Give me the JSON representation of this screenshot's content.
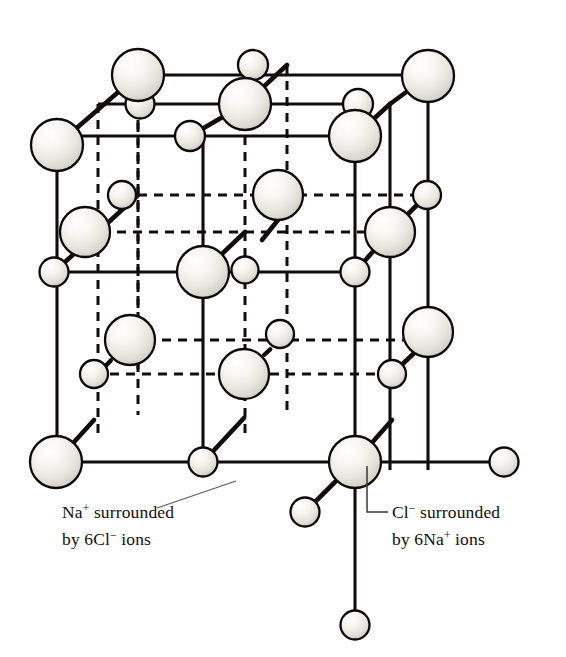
{
  "figure": {
    "background_color": "#ffffff",
    "line_color": "#100d0c",
    "ion_outline_color": "#0d0b0a",
    "ion_fill_light": "#ffffff",
    "ion_fill_mid": "#eceae4",
    "ion_fill_shadow": "#c9c6bd",
    "callout_line_color": "#5d5a59"
  },
  "annotations": [
    {
      "id": "na-callout",
      "name": "na-plus-callout",
      "line1_main": "Na",
      "line1_sup": "+",
      "line1_rest": " surrounded",
      "line2": "by 6Cl",
      "line2_sup": "−",
      "line2_rest": " ions",
      "full_text": "Na+ surrounded by 6Cl− ions",
      "text_x": 62,
      "line1_y": 518,
      "line2_y": 545,
      "leader": {
        "x1": 236,
        "y1": 481,
        "x2": 157,
        "y2": 508
      }
    },
    {
      "id": "cl-callout",
      "name": "cl-minus-callout",
      "line1_main": "Cl",
      "line1_sup": "−",
      "line1_rest": " surrounded",
      "line2": "by 6Na",
      "line2_sup": "+",
      "line2_rest": " ions",
      "full_text": "Cl− surrounded by 6Na+ ions",
      "text_x": 392,
      "line1_y": 518,
      "line2_y": 545,
      "elbow": "M367,466 L367,512 L388,512"
    }
  ],
  "legend": {
    "large_sphere_meaning": "Cl− chloride ion",
    "small_sphere_meaning": "Na+ sodium ion",
    "large_radius": 26,
    "small_radius": 15
  },
  "chart_data": {
    "type": "diagram",
    "ions": [
      {
        "id": "cl-ftl",
        "species": "Cl",
        "cx": 57,
        "cy": 145,
        "r": 26,
        "layer": "front"
      },
      {
        "id": "na-ftl2",
        "species": "Na",
        "cx": 140,
        "cy": 104,
        "r": 14.5,
        "layer": "mid"
      },
      {
        "id": "cl-btl",
        "species": "Cl",
        "cx": 138,
        "cy": 75,
        "r": 26,
        "layer": "back"
      },
      {
        "id": "na-btm",
        "species": "Na",
        "cx": 253,
        "cy": 65,
        "r": 15,
        "layer": "back"
      },
      {
        "id": "cl-btr",
        "species": "Cl",
        "cx": 428,
        "cy": 76,
        "r": 26,
        "layer": "back"
      },
      {
        "id": "na-mtr",
        "species": "Na",
        "cx": 358,
        "cy": 104,
        "r": 15,
        "layer": "mid"
      },
      {
        "id": "cl-mtm",
        "species": "Cl",
        "cx": 245,
        "cy": 104,
        "r": 26,
        "layer": "mid"
      },
      {
        "id": "na-ftm",
        "species": "Na",
        "cx": 190,
        "cy": 136,
        "r": 15,
        "layer": "front"
      },
      {
        "id": "cl-ftr",
        "species": "Cl",
        "cx": 355,
        "cy": 136,
        "r": 26,
        "layer": "front"
      },
      {
        "id": "na-mll",
        "species": "Na",
        "cx": 122,
        "cy": 195,
        "r": 14,
        "layer": "interior"
      },
      {
        "id": "cl-mlc",
        "species": "Cl",
        "cx": 85,
        "cy": 232,
        "r": 25,
        "layer": "interior"
      },
      {
        "id": "cl-ctr",
        "species": "Cl",
        "cx": 278,
        "cy": 195,
        "r": 25,
        "layer": "interior"
      },
      {
        "id": "na-cmr",
        "species": "Na",
        "cx": 427,
        "cy": 195,
        "r": 14,
        "layer": "interior"
      },
      {
        "id": "cl-cmr",
        "species": "Cl",
        "cx": 390,
        "cy": 232,
        "r": 25,
        "layer": "interior"
      },
      {
        "id": "na-bc",
        "species": "Na",
        "cx": 245,
        "cy": 270,
        "r": 13.5,
        "layer": "interior"
      },
      {
        "id": "cl-fcm",
        "species": "Cl",
        "cx": 203,
        "cy": 272,
        "r": 26,
        "layer": "front"
      },
      {
        "id": "na-fml",
        "species": "Na",
        "cx": 54,
        "cy": 272,
        "r": 14.5,
        "layer": "front"
      },
      {
        "id": "na-fmr",
        "species": "Na",
        "cx": 355,
        "cy": 272,
        "r": 14.5,
        "layer": "front"
      },
      {
        "id": "cl-lbl",
        "species": "Cl",
        "cx": 130,
        "cy": 340,
        "r": 25,
        "layer": "interior"
      },
      {
        "id": "na-lbm",
        "species": "Na",
        "cx": 280,
        "cy": 334,
        "r": 14,
        "layer": "interior"
      },
      {
        "id": "cl-rbm",
        "species": "Cl",
        "cx": 428,
        "cy": 332,
        "r": 25,
        "layer": "interior"
      },
      {
        "id": "na-bbl",
        "species": "Na",
        "cx": 94,
        "cy": 374,
        "r": 14,
        "layer": "interior"
      },
      {
        "id": "cl-bbm",
        "species": "Cl",
        "cx": 244,
        "cy": 374,
        "r": 25,
        "layer": "interior"
      },
      {
        "id": "na-bbr",
        "species": "Na",
        "cx": 392,
        "cy": 374,
        "r": 14,
        "layer": "interior"
      },
      {
        "id": "cl-fbl",
        "species": "Cl",
        "cx": 56,
        "cy": 462,
        "r": 26,
        "layer": "front"
      },
      {
        "id": "na-fbm",
        "species": "Na",
        "cx": 203,
        "cy": 462,
        "r": 14.5,
        "layer": "front"
      },
      {
        "id": "cl-fbr",
        "species": "Cl",
        "cx": 355,
        "cy": 462,
        "r": 26,
        "layer": "front"
      },
      {
        "id": "na-ext-right",
        "species": "Na",
        "cx": 504,
        "cy": 462,
        "r": 14.5,
        "layer": "external"
      },
      {
        "id": "na-ext-down",
        "species": "Na",
        "cx": 355,
        "cy": 625,
        "r": 14.5,
        "layer": "external"
      },
      {
        "id": "na-ext-diag",
        "species": "Na",
        "cx": 305,
        "cy": 512,
        "r": 14.5,
        "layer": "external"
      }
    ],
    "coordination": {
      "na_center_label": "Na+ surrounded by 6Cl− ions",
      "cl_center_label": "Cl− surrounded by 6Na+ ions",
      "coordination_number": 6
    }
  }
}
